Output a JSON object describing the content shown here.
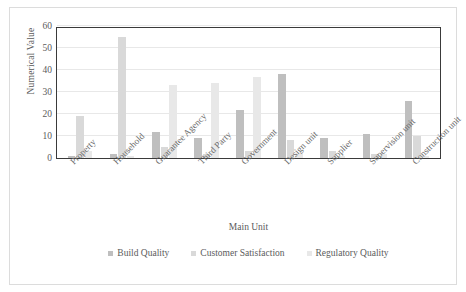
{
  "chart_data": {
    "type": "bar",
    "title": "",
    "xlabel": "Main Unit",
    "ylabel": "Numerical Value",
    "ylim": [
      0,
      60
    ],
    "yticks": [
      0,
      10,
      20,
      30,
      40,
      50,
      60
    ],
    "grid": true,
    "legend_position": "bottom",
    "categories": [
      "Property",
      "Household",
      "Guarantee Agency",
      "Third Party",
      "Government",
      "Design unit",
      "Supplier",
      "Supervision unit",
      "Construction unit"
    ],
    "series": [
      {
        "name": "Build Quality",
        "color": "#bfbfbf",
        "values": [
          1,
          2,
          12,
          9,
          22,
          38,
          9,
          11,
          26
        ]
      },
      {
        "name": "Customer Satisfaction",
        "color": "#d9d9d9",
        "values": [
          19,
          55,
          5,
          2,
          3,
          8,
          3,
          2,
          10
        ]
      },
      {
        "name": "Regulatory Quality",
        "color": "#e8e8e8",
        "values": [
          3,
          1,
          33,
          34,
          37,
          2,
          1,
          2,
          1
        ]
      }
    ]
  },
  "axes": {
    "y_title": "Numerical Value",
    "x_title": "Main Unit"
  },
  "legend": {
    "items": [
      {
        "label": "Build Quality",
        "color": "#bfbfbf"
      },
      {
        "label": "Customer Satisfaction",
        "color": "#d9d9d9"
      },
      {
        "label": "Regulatory Quality",
        "color": "#e8e8e8"
      }
    ]
  }
}
